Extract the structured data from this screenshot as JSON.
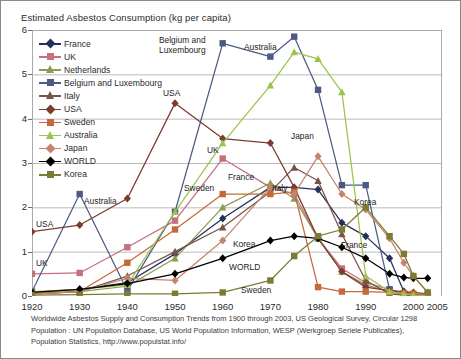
{
  "chart_title": "Estimated Asbestos Consumption  (kg per capita)",
  "footnote": {
    "line1": "Worldwide Asbestos Supply and Consumption Trends from 1900 through 2003, US Geological Survey, Circular 1298",
    "line2": "Population : UN Population Database, US World Population Information, WESP  (Werkgroep Seriele Publicaties),",
    "line3": "Population Statistics, http://www.populstat.info/"
  },
  "legend": {
    "items": [
      {
        "label": "France",
        "color": "#22305c",
        "marker": "diamond"
      },
      {
        "label": "UK",
        "color": "#c4707e",
        "marker": "square"
      },
      {
        "label": "Netherlands",
        "color": "#8f9a52",
        "marker": "triangle"
      },
      {
        "label": "Belgium and Luxembourg",
        "color": "#4c5a84",
        "marker": "square"
      },
      {
        "label": "Italy",
        "color": "#7a5348",
        "marker": "triangle"
      },
      {
        "label": "USA",
        "color": "#7b3b2e",
        "marker": "diamond"
      },
      {
        "label": "Sweden",
        "color": "#c46a3a",
        "marker": "square"
      },
      {
        "label": "Australia",
        "color": "#9cc44c",
        "marker": "triangle"
      },
      {
        "label": "Japan",
        "color": "#c4836c",
        "marker": "diamond"
      },
      {
        "label": "WORLD",
        "color": "#000000",
        "marker": "diamond"
      },
      {
        "label": "Korea",
        "color": "#7d7a33",
        "marker": "square"
      }
    ]
  },
  "annotations": [
    {
      "text": "Belgium and",
      "x": 158,
      "y": 35
    },
    {
      "text": "Luxembourg",
      "x": 158,
      "y": 45
    },
    {
      "text": "Australia",
      "x": 243,
      "y": 42
    },
    {
      "text": "USA",
      "x": 162,
      "y": 88
    },
    {
      "text": "UK",
      "x": 206,
      "y": 145
    },
    {
      "text": "Japan",
      "x": 290,
      "y": 131
    },
    {
      "text": "France",
      "x": 227,
      "y": 172
    },
    {
      "text": "Sweden",
      "x": 183,
      "y": 183
    },
    {
      "text": "Italy",
      "x": 271,
      "y": 183
    },
    {
      "text": "Korea",
      "x": 353,
      "y": 197
    },
    {
      "text": "Australia",
      "x": 83,
      "y": 196
    },
    {
      "text": "USA",
      "x": 35,
      "y": 219
    },
    {
      "text": "Korea",
      "x": 232,
      "y": 239
    },
    {
      "text": "France",
      "x": 340,
      "y": 240
    },
    {
      "text": "UK",
      "x": 35,
      "y": 258
    },
    {
      "text": "WORLD",
      "x": 228,
      "y": 262
    },
    {
      "text": "Sweden",
      "x": 240,
      "y": 285
    }
  ],
  "chart_data": {
    "type": "line",
    "title": "Estimated Asbestos Consumption  (kg per capita)",
    "xlabel": "",
    "ylabel": "kg per capita",
    "xlim": [
      1920,
      2006
    ],
    "ylim": [
      0,
      6
    ],
    "yticks": [
      0,
      1,
      2,
      3,
      4,
      5,
      6
    ],
    "xticks": [
      1920,
      1930,
      1940,
      1950,
      1960,
      1970,
      1980,
      1990,
      2000,
      2005
    ],
    "grid": "horizontal",
    "legend_position": "upper-left-inside",
    "series": [
      {
        "name": "France",
        "color": "#22305c",
        "marker": "diamond",
        "x": [
          1920,
          1930,
          1940,
          1950,
          1960,
          1970,
          1975,
          1980,
          1985,
          1990,
          1995,
          1998,
          2000,
          2003
        ],
        "y": [
          0.08,
          0.15,
          0.3,
          0.95,
          1.75,
          2.45,
          2.45,
          2.4,
          1.65,
          1.35,
          0.85,
          0.1,
          0.03,
          0.02
        ]
      },
      {
        "name": "UK",
        "color": "#c4707e",
        "marker": "square",
        "x": [
          1920,
          1930,
          1940,
          1950,
          1960,
          1970,
          1975,
          1980,
          1985,
          1990,
          1995,
          1998,
          2000,
          2003
        ],
        "y": [
          0.5,
          0.52,
          1.1,
          1.7,
          3.1,
          2.45,
          2.3,
          1.3,
          0.62,
          0.3,
          0.15,
          0.05,
          0.02,
          0.01
        ]
      },
      {
        "name": "Netherlands",
        "color": "#8f9a52",
        "marker": "triangle",
        "x": [
          1920,
          1930,
          1940,
          1950,
          1960,
          1970,
          1975,
          1980,
          1985,
          1990,
          1995,
          1998,
          2000,
          2003
        ],
        "y": [
          0.05,
          0.1,
          0.22,
          0.85,
          2.0,
          2.55,
          2.2,
          1.3,
          0.55,
          0.25,
          0.1,
          0.02,
          0.01,
          0.01
        ]
      },
      {
        "name": "Belgium and Luxembourg",
        "color": "#4c5a84",
        "marker": "square",
        "x": [
          1920,
          1930,
          1940,
          1950,
          1960,
          1970,
          1975,
          1980,
          1985,
          1990,
          1995,
          1998,
          2000,
          2003
        ],
        "y": [
          0.1,
          2.3,
          0.12,
          1.9,
          5.7,
          5.4,
          5.85,
          4.65,
          2.5,
          2.5,
          0.15,
          0.05,
          0.02,
          0.01
        ]
      },
      {
        "name": "Italy",
        "color": "#7a5348",
        "marker": "triangle",
        "x": [
          1920,
          1930,
          1940,
          1950,
          1960,
          1970,
          1975,
          1980,
          1985,
          1990,
          1995,
          1998,
          2000,
          2003
        ],
        "y": [
          0.04,
          0.1,
          0.45,
          1.0,
          1.55,
          2.35,
          2.9,
          2.6,
          1.4,
          0.35,
          0.05,
          0.02,
          0.01,
          0.01
        ]
      },
      {
        "name": "USA",
        "color": "#7b3b2e",
        "marker": "diamond",
        "x": [
          1920,
          1930,
          1940,
          1950,
          1960,
          1970,
          1975,
          1980,
          1985,
          1990,
          1995,
          1998,
          2000,
          2003
        ],
        "y": [
          1.45,
          1.6,
          2.2,
          4.35,
          3.55,
          3.45,
          2.45,
          1.3,
          0.55,
          0.2,
          0.12,
          0.1,
          0.08,
          0.05
        ]
      },
      {
        "name": "Sweden",
        "color": "#c46a3a",
        "marker": "square",
        "x": [
          1920,
          1930,
          1940,
          1950,
          1960,
          1970,
          1975,
          1980,
          1985,
          1990,
          1995,
          1998,
          2000,
          2003
        ],
        "y": [
          0.06,
          0.1,
          0.75,
          1.5,
          2.3,
          2.3,
          2.35,
          0.2,
          0.1,
          0.1,
          0.08,
          0.06,
          0.05,
          0.04
        ]
      },
      {
        "name": "Australia",
        "color": "#9cc44c",
        "marker": "triangle",
        "x": [
          1920,
          1930,
          1940,
          1950,
          1960,
          1970,
          1975,
          1980,
          1985,
          1990,
          1995,
          1998,
          2000,
          2003
        ],
        "y": [
          0.1,
          0.15,
          0.25,
          1.9,
          3.45,
          4.75,
          5.5,
          5.35,
          4.6,
          0.45,
          0.1,
          0.05,
          0.02,
          0.01
        ]
      },
      {
        "name": "Japan",
        "color": "#c4836c",
        "marker": "diamond",
        "x": [
          1920,
          1930,
          1940,
          1950,
          1960,
          1970,
          1975,
          1980,
          1985,
          1990,
          1995,
          1998,
          2000,
          2003
        ],
        "y": [
          0.05,
          0.1,
          0.4,
          0.35,
          1.25,
          2.45,
          2.3,
          3.15,
          2.3,
          1.95,
          1.3,
          0.75,
          0.45,
          0.08
        ]
      },
      {
        "name": "WORLD",
        "color": "#000000",
        "marker": "diamond",
        "x": [
          1920,
          1930,
          1940,
          1950,
          1960,
          1970,
          1975,
          1980,
          1985,
          1990,
          1995,
          1998,
          2000,
          2003
        ],
        "y": [
          0.08,
          0.15,
          0.28,
          0.5,
          0.85,
          1.25,
          1.35,
          1.3,
          1.1,
          0.85,
          0.5,
          0.42,
          0.4,
          0.4
        ]
      },
      {
        "name": "Korea",
        "color": "#7d7a33",
        "marker": "square",
        "x": [
          1920,
          1930,
          1940,
          1950,
          1960,
          1970,
          1975,
          1980,
          1985,
          1990,
          1995,
          1998,
          2000,
          2003
        ],
        "y": [
          0.02,
          0.03,
          0.05,
          0.05,
          0.08,
          0.35,
          0.9,
          1.35,
          1.5,
          2.0,
          1.35,
          0.95,
          0.45,
          0.08
        ]
      }
    ]
  }
}
